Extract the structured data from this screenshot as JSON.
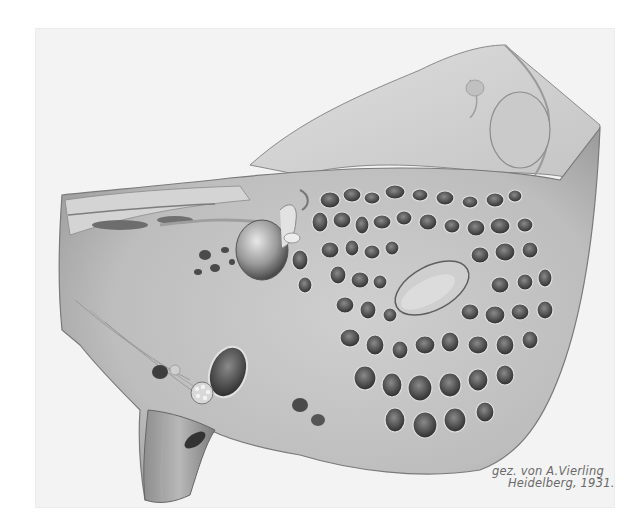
{
  "artwork": {
    "subject": "Anatomical drawing of a temporal bone section with mastoid air cells",
    "colors": {
      "background": "#ffffff",
      "paper": "#f3f3f3",
      "bone_light": "#d9d9d9",
      "bone_mid": "#b5b5b5",
      "bone_dark": "#6e6e6e",
      "cavity": "#3a3a3a",
      "signature": "#6a6a6a"
    }
  },
  "signature": {
    "line1": "gez. von A.Vierling",
    "line2": "Heidelberg, 1931."
  }
}
